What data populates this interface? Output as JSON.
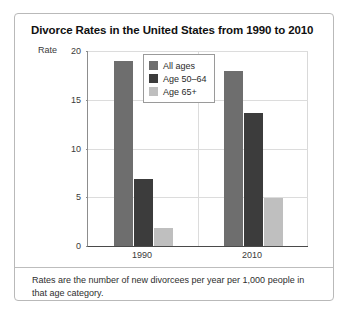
{
  "chart_data": {
    "type": "bar",
    "title": "Divorce Rates in the United States from 1990 to 2010",
    "xlabel": "",
    "ylabel": "Rate",
    "categories": [
      "1990",
      "2010"
    ],
    "series": [
      {
        "name": "All ages",
        "values": [
          19.0,
          17.9
        ],
        "color": "#6e6e6e"
      },
      {
        "name": "Age 50–64",
        "values": [
          6.9,
          13.6
        ],
        "color": "#3c3c3c"
      },
      {
        "name": "Age 65+",
        "values": [
          1.8,
          4.9
        ],
        "color": "#bfbfbf"
      }
    ],
    "ylim": [
      0,
      20
    ],
    "yticks": [
      0,
      5,
      10,
      15,
      20
    ],
    "ytick_labels": [
      "0",
      "5",
      "10",
      "15",
      "20"
    ],
    "grid": true,
    "legend_position": "inside-top-center",
    "note": "Rates are the number of new divorcees per year per 1,000 people in that age category."
  },
  "colors": {
    "all_ages": "#6e6e6e",
    "age_50_64": "#3c3c3c",
    "age_65_plus": "#bfbfbf",
    "axis": "#4a4a4a",
    "grid": "#dcdcdc",
    "card_border": "#b9b9b9",
    "text": "#2e2e2e"
  }
}
